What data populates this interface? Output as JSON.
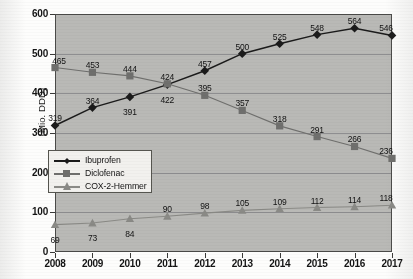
{
  "chart_data": {
    "type": "line",
    "title": "",
    "xlabel": "",
    "ylabel": "(Mio. DDD)",
    "ylim": [
      0,
      600
    ],
    "yticks": [
      0,
      100,
      200,
      300,
      400,
      500,
      600
    ],
    "grid": true,
    "legend_position": "inner-left",
    "categories": [
      "2008",
      "2009",
      "2010",
      "2011",
      "2012",
      "2013",
      "2014",
      "2015",
      "2016",
      "2017"
    ],
    "series": [
      {
        "name": "Ibuprofen",
        "marker": "diamond",
        "color": "#1b1b1b",
        "values": [
          319,
          364,
          391,
          422,
          457,
          500,
          525,
          548,
          564,
          546
        ]
      },
      {
        "name": "Diclofenac",
        "marker": "square",
        "color": "#6f6f6d",
        "values": [
          465,
          453,
          444,
          424,
          395,
          357,
          318,
          291,
          266,
          236
        ]
      },
      {
        "name": "COX-2-Hemmer",
        "marker": "triangle",
        "color": "#8a8a86",
        "values": [
          69,
          73,
          84,
          90,
          98,
          105,
          109,
          112,
          114,
          118
        ]
      }
    ]
  },
  "axes": {
    "y_label": "(Mio. DDD)",
    "y_tick_labels": [
      "600",
      "500",
      "400",
      "300",
      "200",
      "100",
      "0"
    ],
    "x_tick_labels": [
      "2008",
      "2009",
      "2010",
      "2011",
      "2012",
      "2013",
      "2014",
      "2015",
      "2016",
      "2017"
    ]
  },
  "legend": {
    "items": [
      {
        "label": "Ibuprofen",
        "marker": "diamond",
        "color": "#1b1b1b"
      },
      {
        "label": "Diclofenac",
        "marker": "square",
        "color": "#6f6f6d"
      },
      {
        "label": "COX-2-Hemmer",
        "marker": "triangle",
        "color": "#8a8a86"
      }
    ]
  },
  "colors": {
    "plot_background": "#b9b9b6",
    "page_background": "#fdfdfc",
    "gridline": "#86868a",
    "axis": "#3a3a38",
    "ibuprofen": "#1b1b1b",
    "diclofenac": "#6f6f6d",
    "cox2": "#8a8a86"
  }
}
